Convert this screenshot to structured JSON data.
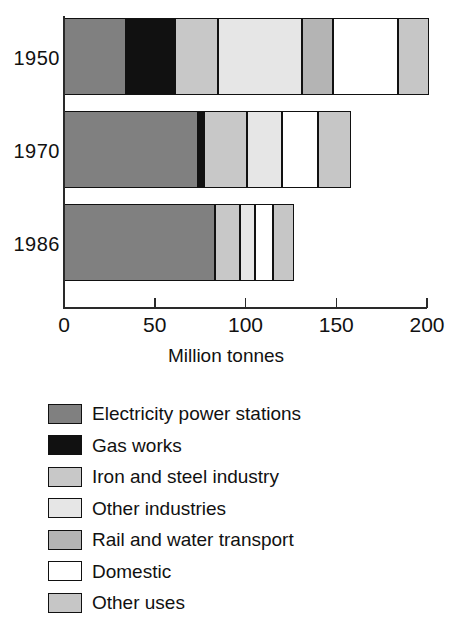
{
  "chart_data": {
    "type": "bar",
    "orientation": "horizontal",
    "stacked": true,
    "title": "",
    "subtitle": "",
    "xlabel": "Million tonnes",
    "ylabel": "",
    "xlim": [
      0,
      200
    ],
    "xticks": [
      0,
      50,
      100,
      150,
      200
    ],
    "xtick_labels": [
      "0",
      "50",
      "100",
      "150",
      "200"
    ],
    "grid": false,
    "legend_position": "below",
    "categories": [
      "1950",
      "1970",
      "1986"
    ],
    "series": [
      {
        "name": "Electricity power stations",
        "color": "#808080",
        "values": [
          34,
          74,
          83
        ]
      },
      {
        "name": "Gas works",
        "color": "#111111",
        "values": [
          27,
          3,
          0
        ]
      },
      {
        "name": "Iron and steel industry",
        "color": "#c8c8c8",
        "values": [
          24,
          24,
          14
        ]
      },
      {
        "name": "Other industries",
        "color": "#e4e4e4",
        "values": [
          46,
          19,
          8
        ]
      },
      {
        "name": "Rail and water transport",
        "color": "#b4b4b4",
        "values": [
          17,
          0,
          0
        ]
      },
      {
        "name": "Domestic",
        "color": "#ffffff",
        "values": [
          36,
          20,
          10
        ]
      },
      {
        "name": "Other uses",
        "color": "#c0c0c0",
        "values": [
          17,
          18,
          12
        ]
      }
    ],
    "totals": [
      201,
      158,
      127
    ],
    "units": "Million tonnes"
  },
  "axis": {
    "x_title": "Million tonnes",
    "ticks": [
      "0",
      "50",
      "100",
      "150",
      "200"
    ]
  },
  "bars": [
    {
      "year": "1950",
      "segments": [
        {
          "label": "Electricity power stations",
          "value": 34,
          "color": "#808080"
        },
        {
          "label": "Gas works",
          "value": 27,
          "color": "#111111"
        },
        {
          "label": "Iron and steel industry",
          "value": 24,
          "color": "#c8c8c8"
        },
        {
          "label": "Other industries",
          "value": 46,
          "color": "#e6e6e6"
        },
        {
          "label": "Rail and water transport",
          "value": 17,
          "color": "#b4b4b4"
        },
        {
          "label": "Domestic",
          "value": 36,
          "color": "#ffffff"
        },
        {
          "label": "Other uses",
          "value": 17,
          "color": "#c6c6c6"
        }
      ]
    },
    {
      "year": "1970",
      "segments": [
        {
          "label": "Electricity power stations",
          "value": 74,
          "color": "#808080"
        },
        {
          "label": "Gas works",
          "value": 3,
          "color": "#111111"
        },
        {
          "label": "Iron and steel industry",
          "value": 24,
          "color": "#c8c8c8"
        },
        {
          "label": "Other industries",
          "value": 19,
          "color": "#e6e6e6"
        },
        {
          "label": "Domestic",
          "value": 20,
          "color": "#ffffff"
        },
        {
          "label": "Other uses",
          "value": 18,
          "color": "#c6c6c6"
        }
      ]
    },
    {
      "year": "1986",
      "segments": [
        {
          "label": "Electricity power stations",
          "value": 83,
          "color": "#808080"
        },
        {
          "label": "Iron and steel industry",
          "value": 14,
          "color": "#c8c8c8"
        },
        {
          "label": "Other industries",
          "value": 8,
          "color": "#e6e6e6"
        },
        {
          "label": "Domestic",
          "value": 10,
          "color": "#ffffff"
        },
        {
          "label": "Other uses",
          "value": 12,
          "color": "#c6c6c6"
        }
      ]
    }
  ],
  "legend": {
    "items": [
      {
        "label": "Electricity power stations",
        "color": "#808080"
      },
      {
        "label": "Gas works",
        "color": "#111111"
      },
      {
        "label": "Iron and steel industry",
        "color": "#c8c8c8"
      },
      {
        "label": "Other industries",
        "color": "#e6e6e6"
      },
      {
        "label": "Rail and water transport",
        "color": "#b4b4b4"
      },
      {
        "label": "Domestic",
        "color": "#ffffff"
      },
      {
        "label": "Other uses",
        "color": "#c6c6c6"
      }
    ]
  }
}
